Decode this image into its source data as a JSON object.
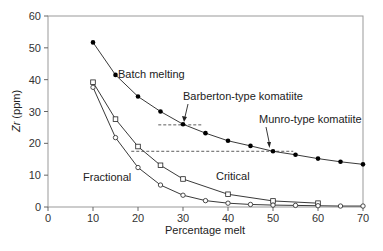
{
  "chart_data": {
    "type": "line",
    "title": "",
    "xlabel": "Percentage melt",
    "ylabel": "Zr (ppm)",
    "xlim": [
      0,
      70
    ],
    "ylim": [
      0,
      60
    ],
    "xticks": [
      0,
      10,
      20,
      30,
      40,
      50,
      60,
      70
    ],
    "yticks": [
      0,
      10,
      20,
      30,
      40,
      50,
      60
    ],
    "grid": false,
    "series": [
      {
        "name": "Batch melting",
        "marker": "filled-circle",
        "x": [
          10,
          15,
          20,
          25,
          30,
          35,
          40,
          45,
          50,
          55,
          60,
          65,
          70
        ],
        "y": [
          51.7,
          41.5,
          34.7,
          30.0,
          26.0,
          23.2,
          20.8,
          19.2,
          17.5,
          16.4,
          15.2,
          14.2,
          13.4
        ]
      },
      {
        "name": "Critical",
        "marker": "open-square",
        "x": [
          10,
          15,
          20,
          25,
          30,
          40,
          50,
          60
        ],
        "y": [
          39.2,
          27.6,
          19.0,
          13.1,
          8.8,
          4.0,
          1.9,
          1.2
        ]
      },
      {
        "name": "Fractional",
        "marker": "open-circle",
        "x": [
          10,
          15,
          20,
          25,
          30,
          35,
          40,
          45,
          50,
          55,
          60,
          65,
          70
        ],
        "y": [
          37.6,
          21.8,
          12.4,
          6.9,
          3.7,
          2.0,
          1.2,
          0.8,
          0.6,
          0.5,
          0.4,
          0.3,
          0.3
        ]
      }
    ],
    "reference_lines": [
      {
        "name": "Barberton-type komatiite",
        "y": 25.8,
        "x_range": [
          24.5,
          34.5
        ]
      },
      {
        "name": "Munro-type komatiite",
        "y": 17.5,
        "x_range": [
          18.5,
          54.5
        ]
      }
    ],
    "annotations": [
      {
        "text": "Batch melting",
        "near_series": "Batch melting"
      },
      {
        "text": "Barberton-type komatiite",
        "points_to": [
          30,
          26.0
        ]
      },
      {
        "text": "Munro-type komatiite",
        "points_to": [
          50,
          17.5
        ]
      },
      {
        "text": "Critical",
        "near_series": "Critical"
      },
      {
        "text": "Fractional",
        "near_series": "Fractional"
      }
    ]
  },
  "labels": {
    "batch": "Batch melting",
    "barberton": "Barberton-type komatiite",
    "munro": "Munro-type komatiite",
    "critical": "Critical",
    "fractional": "Fractional"
  },
  "caption_fragment": ""
}
